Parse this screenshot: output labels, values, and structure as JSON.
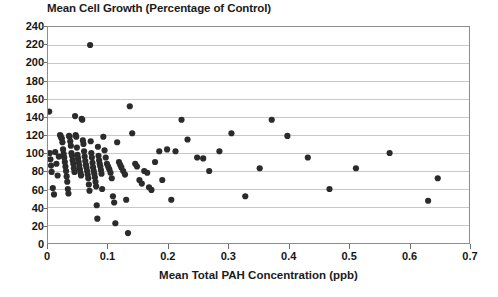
{
  "chart_data": {
    "type": "scatter",
    "title": "Mean Cell Growth (Percentage of Control)",
    "xlabel": "Mean Total PAH Concentration (ppb)",
    "ylabel": "",
    "xlim": [
      0,
      0.7
    ],
    "ylim": [
      0,
      240
    ],
    "xticks": [
      0,
      0.1,
      0.2,
      0.3,
      0.4,
      0.5,
      0.6,
      0.7
    ],
    "xtick_labels": [
      "0",
      "0.1",
      "0.2",
      "0.3",
      "0.4",
      "0.5",
      "0.6",
      "0.7"
    ],
    "yticks": [
      0,
      20,
      40,
      60,
      80,
      100,
      120,
      140,
      160,
      180,
      200,
      220,
      240
    ],
    "ytick_labels": [
      "0",
      "20",
      "40",
      "60",
      "80",
      "100",
      "120",
      "140",
      "160",
      "180",
      "200",
      "220",
      "240"
    ],
    "grid": "horizontal",
    "grid_color": "#c8c8c8",
    "marker_color": "#2b2b2b",
    "marker_size": 3.1,
    "legend": null,
    "series": [
      {
        "name": "Mean Cell Growth vs PAH",
        "points": [
          [
            0.002,
            146
          ],
          [
            0.003,
            100
          ],
          [
            0.004,
            93
          ],
          [
            0.005,
            86
          ],
          [
            0.006,
            79
          ],
          [
            0.008,
            61
          ],
          [
            0.01,
            54
          ],
          [
            0.012,
            101
          ],
          [
            0.014,
            88
          ],
          [
            0.016,
            75
          ],
          [
            0.018,
            96
          ],
          [
            0.02,
            120
          ],
          [
            0.021,
            119
          ],
          [
            0.022,
            117
          ],
          [
            0.023,
            116
          ],
          [
            0.024,
            112
          ],
          [
            0.025,
            104
          ],
          [
            0.026,
            99
          ],
          [
            0.027,
            95
          ],
          [
            0.028,
            90
          ],
          [
            0.029,
            85
          ],
          [
            0.03,
            80
          ],
          [
            0.031,
            74
          ],
          [
            0.032,
            68
          ],
          [
            0.033,
            60
          ],
          [
            0.034,
            55
          ],
          [
            0.035,
            119
          ],
          [
            0.036,
            118
          ],
          [
            0.037,
            113
          ],
          [
            0.038,
            108
          ],
          [
            0.039,
            100
          ],
          [
            0.04,
            97
          ],
          [
            0.041,
            92
          ],
          [
            0.042,
            88
          ],
          [
            0.043,
            83
          ],
          [
            0.044,
            79
          ],
          [
            0.045,
            141
          ],
          [
            0.046,
            120
          ],
          [
            0.047,
            118
          ],
          [
            0.048,
            106
          ],
          [
            0.049,
            98
          ],
          [
            0.05,
            94
          ],
          [
            0.051,
            90
          ],
          [
            0.052,
            86
          ],
          [
            0.053,
            82
          ],
          [
            0.054,
            78
          ],
          [
            0.055,
            75
          ],
          [
            0.056,
            138
          ],
          [
            0.057,
            137
          ],
          [
            0.058,
            114
          ],
          [
            0.059,
            110
          ],
          [
            0.06,
            102
          ],
          [
            0.061,
            96
          ],
          [
            0.062,
            91
          ],
          [
            0.063,
            87
          ],
          [
            0.064,
            84
          ],
          [
            0.065,
            80
          ],
          [
            0.066,
            76
          ],
          [
            0.067,
            72
          ],
          [
            0.068,
            65
          ],
          [
            0.069,
            58
          ],
          [
            0.07,
            220
          ],
          [
            0.071,
            113
          ],
          [
            0.072,
            100
          ],
          [
            0.073,
            95
          ],
          [
            0.074,
            89
          ],
          [
            0.075,
            84
          ],
          [
            0.076,
            80
          ],
          [
            0.077,
            77
          ],
          [
            0.078,
            73
          ],
          [
            0.079,
            68
          ],
          [
            0.08,
            63
          ],
          [
            0.081,
            42
          ],
          [
            0.082,
            27
          ],
          [
            0.083,
            107
          ],
          [
            0.084,
            97
          ],
          [
            0.085,
            92
          ],
          [
            0.086,
            88
          ],
          [
            0.087,
            85
          ],
          [
            0.088,
            81
          ],
          [
            0.089,
            77
          ],
          [
            0.09,
            60
          ],
          [
            0.092,
            118
          ],
          [
            0.094,
            103
          ],
          [
            0.096,
            95
          ],
          [
            0.098,
            88
          ],
          [
            0.1,
            85
          ],
          [
            0.102,
            82
          ],
          [
            0.104,
            78
          ],
          [
            0.106,
            72
          ],
          [
            0.108,
            52
          ],
          [
            0.11,
            45
          ],
          [
            0.112,
            22
          ],
          [
            0.115,
            112
          ],
          [
            0.118,
            90
          ],
          [
            0.12,
            87
          ],
          [
            0.122,
            84
          ],
          [
            0.125,
            80
          ],
          [
            0.128,
            76
          ],
          [
            0.13,
            48
          ],
          [
            0.133,
            11
          ],
          [
            0.136,
            152
          ],
          [
            0.14,
            122
          ],
          [
            0.145,
            88
          ],
          [
            0.148,
            85
          ],
          [
            0.152,
            70
          ],
          [
            0.156,
            66
          ],
          [
            0.16,
            80
          ],
          [
            0.165,
            78
          ],
          [
            0.168,
            62
          ],
          [
            0.172,
            59
          ],
          [
            0.178,
            90
          ],
          [
            0.185,
            102
          ],
          [
            0.19,
            70
          ],
          [
            0.198,
            104
          ],
          [
            0.205,
            48
          ],
          [
            0.212,
            102
          ],
          [
            0.222,
            137
          ],
          [
            0.232,
            115
          ],
          [
            0.248,
            95
          ],
          [
            0.258,
            94
          ],
          [
            0.268,
            80
          ],
          [
            0.285,
            102
          ],
          [
            0.305,
            122
          ],
          [
            0.328,
            52
          ],
          [
            0.352,
            83
          ],
          [
            0.372,
            137
          ],
          [
            0.398,
            119
          ],
          [
            0.432,
            95
          ],
          [
            0.468,
            60
          ],
          [
            0.512,
            83
          ],
          [
            0.568,
            100
          ],
          [
            0.632,
            47
          ],
          [
            0.648,
            72
          ]
        ]
      }
    ]
  }
}
